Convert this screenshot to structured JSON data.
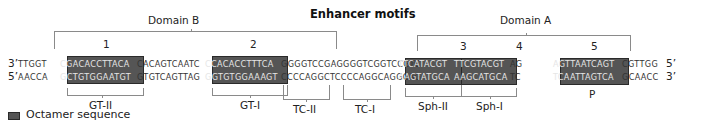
{
  "title": "Enhancer motifs",
  "domains": [
    {
      "label": "Domain B",
      "motifs": [
        "1",
        "2"
      ]
    },
    {
      "label": "Domain A",
      "motifs": [
        "3",
        "4",
        "5"
      ]
    }
  ],
  "motif_numbers": [
    "1",
    "2",
    "3",
    "4",
    "5"
  ],
  "top_strand": {
    "left_end": "3’",
    "right_end": "5’",
    "segments": [
      "TTGGT",
      "CGACACCTTACA",
      "CACAGTCAATC",
      "CCACACCTTTCA",
      "GGGGTCCGAGGGGTCGGTCCGTC",
      "TTCATACGT",
      "TTCGTACGT",
      "AG",
      "AGTTAATCAGT",
      "CGTTGG"
    ]
  },
  "bottom_strand": {
    "left_end": "5’",
    "right_end": "3’",
    "segments": [
      "AACCA",
      "GCTGTGGAATGT",
      "GTGTCAGTTAG",
      "GGTGTGGAAAGT",
      "CCCCAGGCTCCCCAGGCAGGCAG",
      "AAGTATGCA",
      "AAGCATGCA",
      "TC",
      "TCAATTAGTCA",
      "GCAACC"
    ]
  },
  "elements": [
    "GT-II",
    "GT-I",
    "TC-II",
    "TC-I",
    "Sph-II",
    "Sph-I",
    "P"
  ],
  "legend": {
    "label": "Octamer sequence",
    "swatch_color": "#555555"
  },
  "colors": {
    "octamer_box": "#555555",
    "bracket": "#8a8a8a",
    "text": "#222222"
  }
}
